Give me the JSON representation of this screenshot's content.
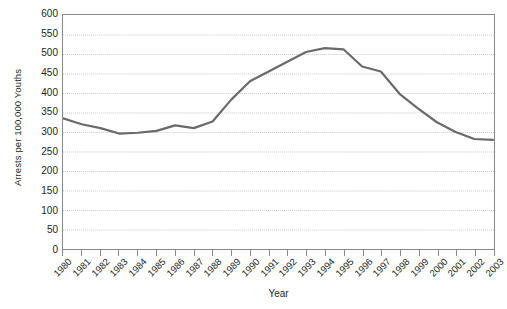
{
  "chart_data": {
    "type": "line",
    "title": "",
    "xlabel": "Year",
    "ylabel": "Arrests per 100,000 Youths",
    "x": [
      1980,
      1981,
      1982,
      1983,
      1984,
      1985,
      1986,
      1987,
      1988,
      1989,
      1990,
      1991,
      1992,
      1993,
      1994,
      1995,
      1996,
      1997,
      1998,
      1999,
      2000,
      2001,
      2002,
      2003
    ],
    "categories": [
      "1980",
      "1981",
      "1982",
      "1983",
      "1984",
      "1985",
      "1986",
      "1987",
      "1988",
      "1989",
      "1990",
      "1991",
      "1992",
      "1993",
      "1994",
      "1995",
      "1996",
      "1997",
      "1998",
      "1999",
      "2000",
      "2001",
      "2002",
      "2003"
    ],
    "values": [
      335,
      320,
      310,
      296,
      298,
      303,
      317,
      310,
      327,
      383,
      430,
      455,
      480,
      505,
      515,
      512,
      468,
      455,
      398,
      360,
      325,
      300,
      282,
      280
    ],
    "series": [
      {
        "name": "Juvenile violent crime arrest rate",
        "values": [
          335,
          320,
          310,
          296,
          298,
          303,
          317,
          310,
          327,
          383,
          430,
          455,
          480,
          505,
          515,
          512,
          468,
          455,
          398,
          360,
          325,
          300,
          282,
          280
        ]
      }
    ],
    "yticks": [
      0,
      50,
      100,
      150,
      200,
      250,
      300,
      350,
      400,
      450,
      500,
      550,
      600
    ],
    "ylim": [
      0,
      600
    ],
    "xlim": [
      1980,
      2003
    ],
    "grid": true,
    "grid_axis": "y",
    "legend": false,
    "legend_position": "none",
    "line_color": "#6a6a6a",
    "grid_color": "#c8c8c8",
    "axis_color": "#8a8a8a",
    "background_color": "#ffffff",
    "text_color": "#231f20"
  }
}
